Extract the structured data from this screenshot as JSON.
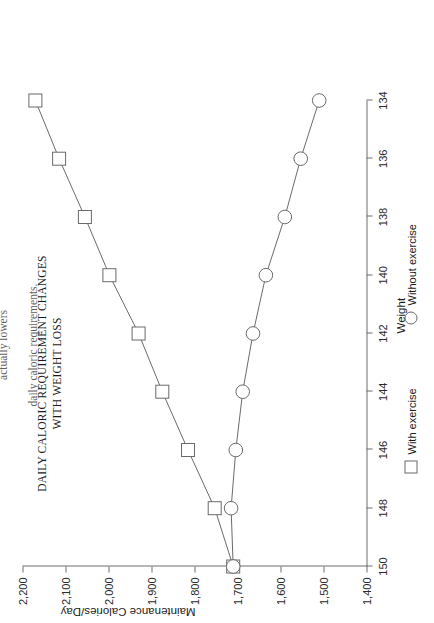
{
  "page": {
    "body_text_line1": "Tables 3 and 4 below.  Note:  a weight loss program without exercise actually lowers",
    "body_text_line2": "daily caloric requirements."
  },
  "legend": {
    "with_exercise": "With exercise",
    "without_exercise": "Without exercise",
    "with_exercise_icon": "square-marker-icon",
    "without_exercise_icon": "circle-marker-icon"
  },
  "chart_data": {
    "type": "line",
    "title": "DAILY CALORIC REQUIREMENT CHANGES WITH WEIGHT LOSS",
    "title_line1": "DAILY CALORIC REQUIREMENT CHANGES",
    "title_line2": "WITH WEIGHT LOSS",
    "xlabel": "Weight",
    "ylabel": "Maintenance Calories/Day",
    "x": [
      150,
      148,
      146,
      144,
      142,
      140,
      138,
      136,
      134
    ],
    "xticks": [
      "150",
      "148",
      "146",
      "144",
      "142",
      "140",
      "138",
      "136",
      "134"
    ],
    "yticks": [
      "1,400",
      "1,500",
      "1,600",
      "1,700",
      "1,800",
      "1,900",
      "2,000",
      "2,100",
      "2,200"
    ],
    "ytick_values": [
      1400,
      1500,
      1600,
      1700,
      1800,
      1900,
      2000,
      2100,
      2200
    ],
    "xlim": [
      150,
      134
    ],
    "ylim": [
      1400,
      2200
    ],
    "grid": false,
    "legend_position": "bottom",
    "series": [
      {
        "name": "With exercise",
        "marker": "square",
        "values": [
          1710,
          1753,
          1815,
          1875,
          1930,
          1998,
          2055,
          2115,
          2170
        ]
      },
      {
        "name": "Without exercise",
        "marker": "circle",
        "values": [
          1710,
          1715,
          1704,
          1688,
          1664,
          1634,
          1590,
          1553,
          1510
        ]
      }
    ]
  }
}
